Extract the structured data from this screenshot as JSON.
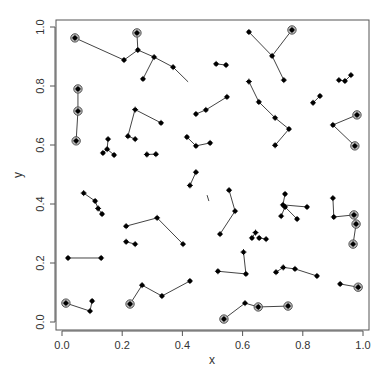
{
  "chart_data": {
    "type": "scatter",
    "title": "",
    "xlabel": "x",
    "ylabel": "y",
    "xlim": [
      0,
      1
    ],
    "ylim": [
      0,
      1
    ],
    "grid": false,
    "x_ticks": [
      "0.0",
      "0.2",
      "0.4",
      "0.6",
      "0.8",
      "1.0"
    ],
    "y_ticks": [
      "0.0",
      "0.2",
      "0.4",
      "0.6",
      "0.8",
      "1.0"
    ],
    "segments": [
      [
        [
          0.043,
          0.963
        ],
        [
          0.206,
          0.888
        ]
      ],
      [
        [
          0.206,
          0.888
        ],
        [
          0.252,
          0.922
        ]
      ],
      [
        [
          0.252,
          0.922
        ],
        [
          0.249,
          0.98
        ]
      ],
      [
        [
          0.252,
          0.922
        ],
        [
          0.306,
          0.898
        ]
      ],
      [
        [
          0.306,
          0.898
        ],
        [
          0.269,
          0.824
        ]
      ],
      [
        [
          0.306,
          0.898
        ],
        [
          0.369,
          0.864
        ]
      ],
      [
        [
          0.369,
          0.864
        ],
        [
          0.419,
          0.814
        ]
      ],
      [
        [
          0.053,
          0.79
        ],
        [
          0.053,
          0.715
        ]
      ],
      [
        [
          0.053,
          0.715
        ],
        [
          0.047,
          0.614
        ]
      ],
      [
        [
          0.243,
          0.722
        ],
        [
          0.219,
          0.63
        ]
      ],
      [
        [
          0.219,
          0.63
        ],
        [
          0.243,
          0.62
        ]
      ],
      [
        [
          0.243,
          0.72
        ],
        [
          0.329,
          0.675
        ]
      ],
      [
        [
          0.153,
          0.62
        ],
        [
          0.15,
          0.586
        ]
      ],
      [
        [
          0.15,
          0.586
        ],
        [
          0.136,
          0.573
        ]
      ],
      [
        [
          0.15,
          0.586
        ],
        [
          0.173,
          0.566
        ]
      ],
      [
        [
          0.282,
          0.568
        ],
        [
          0.312,
          0.569
        ]
      ],
      [
        [
          0.512,
          0.875
        ],
        [
          0.545,
          0.871
        ]
      ],
      [
        [
          0.445,
          0.705
        ],
        [
          0.478,
          0.719
        ]
      ],
      [
        [
          0.478,
          0.719
        ],
        [
          0.548,
          0.763
        ]
      ],
      [
        [
          0.415,
          0.627
        ],
        [
          0.445,
          0.597
        ]
      ],
      [
        [
          0.445,
          0.597
        ],
        [
          0.492,
          0.607
        ]
      ],
      [
        [
          0.425,
          0.463
        ],
        [
          0.445,
          0.508
        ]
      ],
      [
        [
          0.621,
          0.983
        ],
        [
          0.698,
          0.902
        ]
      ],
      [
        [
          0.698,
          0.902
        ],
        [
          0.764,
          0.99
        ]
      ],
      [
        [
          0.698,
          0.902
        ],
        [
          0.737,
          0.82
        ]
      ],
      [
        [
          0.621,
          0.815
        ],
        [
          0.654,
          0.746
        ]
      ],
      [
        [
          0.654,
          0.746
        ],
        [
          0.708,
          0.692
        ]
      ],
      [
        [
          0.708,
          0.692
        ],
        [
          0.754,
          0.654
        ]
      ],
      [
        [
          0.754,
          0.654
        ],
        [
          0.708,
          0.599
        ]
      ],
      [
        [
          0.92,
          0.82
        ],
        [
          0.94,
          0.817
        ]
      ],
      [
        [
          0.94,
          0.817
        ],
        [
          0.96,
          0.837
        ]
      ],
      [
        [
          0.834,
          0.743
        ],
        [
          0.857,
          0.766
        ]
      ],
      [
        [
          0.9,
          0.668
        ],
        [
          0.98,
          0.702
        ]
      ],
      [
        [
          0.9,
          0.668
        ],
        [
          0.973,
          0.597
        ]
      ],
      [
        [
          0.072,
          0.437
        ],
        [
          0.11,
          0.41
        ]
      ],
      [
        [
          0.11,
          0.41
        ],
        [
          0.12,
          0.385
        ]
      ],
      [
        [
          0.12,
          0.385
        ],
        [
          0.133,
          0.366
        ]
      ],
      [
        [
          0.213,
          0.325
        ],
        [
          0.316,
          0.353
        ]
      ],
      [
        [
          0.316,
          0.353
        ],
        [
          0.402,
          0.264
        ]
      ],
      [
        [
          0.213,
          0.272
        ],
        [
          0.243,
          0.264
        ]
      ],
      [
        [
          0.02,
          0.217
        ],
        [
          0.13,
          0.217
        ]
      ],
      [
        [
          0.013,
          0.064
        ],
        [
          0.093,
          0.037
        ]
      ],
      [
        [
          0.093,
          0.037
        ],
        [
          0.1,
          0.071
        ]
      ],
      [
        [
          0.226,
          0.061
        ],
        [
          0.266,
          0.125
        ]
      ],
      [
        [
          0.266,
          0.125
        ],
        [
          0.332,
          0.088
        ]
      ],
      [
        [
          0.332,
          0.088
        ],
        [
          0.425,
          0.139
        ]
      ],
      [
        [
          0.555,
          0.447
        ],
        [
          0.575,
          0.376
        ]
      ],
      [
        [
          0.575,
          0.376
        ],
        [
          0.525,
          0.298
        ]
      ],
      [
        [
          0.482,
          0.43
        ],
        [
          0.488,
          0.41
        ]
      ],
      [
        [
          0.741,
          0.434
        ],
        [
          0.734,
          0.397
        ]
      ],
      [
        [
          0.734,
          0.397
        ],
        [
          0.814,
          0.39
        ]
      ],
      [
        [
          0.728,
          0.359
        ],
        [
          0.741,
          0.39
        ]
      ],
      [
        [
          0.741,
          0.39
        ],
        [
          0.781,
          0.349
        ]
      ],
      [
        [
          0.9,
          0.42
        ],
        [
          0.903,
          0.356
        ]
      ],
      [
        [
          0.903,
          0.356
        ],
        [
          0.97,
          0.363
        ]
      ],
      [
        [
          0.97,
          0.363
        ],
        [
          0.977,
          0.332
        ]
      ],
      [
        [
          0.977,
          0.332
        ],
        [
          0.967,
          0.264
        ]
      ],
      [
        [
          0.631,
          0.285
        ],
        [
          0.643,
          0.303
        ]
      ],
      [
        [
          0.603,
          0.237
        ],
        [
          0.611,
          0.163
        ]
      ],
      [
        [
          0.611,
          0.163
        ],
        [
          0.518,
          0.172
        ]
      ],
      [
        [
          0.655,
          0.285
        ],
        [
          0.678,
          0.281
        ]
      ],
      [
        [
          0.711,
          0.169
        ],
        [
          0.735,
          0.185
        ]
      ],
      [
        [
          0.735,
          0.185
        ],
        [
          0.774,
          0.18
        ]
      ],
      [
        [
          0.774,
          0.18
        ],
        [
          0.847,
          0.156
        ]
      ],
      [
        [
          0.924,
          0.129
        ],
        [
          0.984,
          0.118
        ]
      ],
      [
        [
          0.538,
          0.01
        ],
        [
          0.608,
          0.064
        ]
      ],
      [
        [
          0.608,
          0.064
        ],
        [
          0.652,
          0.051
        ]
      ],
      [
        [
          0.652,
          0.051
        ],
        [
          0.751,
          0.054
        ]
      ]
    ],
    "points": [
      {
        "x": 0.043,
        "y": 0.963,
        "circled": true
      },
      {
        "x": 0.206,
        "y": 0.888,
        "circled": false
      },
      {
        "x": 0.252,
        "y": 0.922,
        "circled": false
      },
      {
        "x": 0.249,
        "y": 0.98,
        "circled": true
      },
      {
        "x": 0.306,
        "y": 0.898,
        "circled": false
      },
      {
        "x": 0.269,
        "y": 0.824,
        "circled": false
      },
      {
        "x": 0.369,
        "y": 0.864,
        "circled": false
      },
      {
        "x": 0.053,
        "y": 0.79,
        "circled": true
      },
      {
        "x": 0.053,
        "y": 0.715,
        "circled": true
      },
      {
        "x": 0.047,
        "y": 0.614,
        "circled": true
      },
      {
        "x": 0.243,
        "y": 0.72,
        "circled": false
      },
      {
        "x": 0.219,
        "y": 0.63,
        "circled": false
      },
      {
        "x": 0.243,
        "y": 0.62,
        "circled": false
      },
      {
        "x": 0.329,
        "y": 0.675,
        "circled": false
      },
      {
        "x": 0.153,
        "y": 0.62,
        "circled": false
      },
      {
        "x": 0.15,
        "y": 0.586,
        "circled": false
      },
      {
        "x": 0.136,
        "y": 0.573,
        "circled": false
      },
      {
        "x": 0.173,
        "y": 0.566,
        "circled": false
      },
      {
        "x": 0.282,
        "y": 0.568,
        "circled": false
      },
      {
        "x": 0.312,
        "y": 0.569,
        "circled": false
      },
      {
        "x": 0.512,
        "y": 0.875,
        "circled": false
      },
      {
        "x": 0.545,
        "y": 0.871,
        "circled": false
      },
      {
        "x": 0.445,
        "y": 0.705,
        "circled": false
      },
      {
        "x": 0.478,
        "y": 0.719,
        "circled": false
      },
      {
        "x": 0.548,
        "y": 0.763,
        "circled": false
      },
      {
        "x": 0.415,
        "y": 0.627,
        "circled": false
      },
      {
        "x": 0.445,
        "y": 0.597,
        "circled": false
      },
      {
        "x": 0.492,
        "y": 0.607,
        "circled": false
      },
      {
        "x": 0.425,
        "y": 0.463,
        "circled": false
      },
      {
        "x": 0.445,
        "y": 0.508,
        "circled": false
      },
      {
        "x": 0.621,
        "y": 0.983,
        "circled": false
      },
      {
        "x": 0.698,
        "y": 0.902,
        "circled": false
      },
      {
        "x": 0.764,
        "y": 0.99,
        "circled": true
      },
      {
        "x": 0.737,
        "y": 0.82,
        "circled": false
      },
      {
        "x": 0.621,
        "y": 0.815,
        "circled": false
      },
      {
        "x": 0.654,
        "y": 0.746,
        "circled": false
      },
      {
        "x": 0.708,
        "y": 0.692,
        "circled": false
      },
      {
        "x": 0.754,
        "y": 0.654,
        "circled": false
      },
      {
        "x": 0.708,
        "y": 0.599,
        "circled": false
      },
      {
        "x": 0.92,
        "y": 0.82,
        "circled": false
      },
      {
        "x": 0.94,
        "y": 0.817,
        "circled": false
      },
      {
        "x": 0.96,
        "y": 0.837,
        "circled": false
      },
      {
        "x": 0.834,
        "y": 0.743,
        "circled": false
      },
      {
        "x": 0.857,
        "y": 0.766,
        "circled": false
      },
      {
        "x": 0.9,
        "y": 0.668,
        "circled": false
      },
      {
        "x": 0.98,
        "y": 0.702,
        "circled": true
      },
      {
        "x": 0.973,
        "y": 0.597,
        "circled": true
      },
      {
        "x": 0.072,
        "y": 0.437,
        "circled": false
      },
      {
        "x": 0.11,
        "y": 0.41,
        "circled": false
      },
      {
        "x": 0.12,
        "y": 0.385,
        "circled": false
      },
      {
        "x": 0.133,
        "y": 0.366,
        "circled": false
      },
      {
        "x": 0.213,
        "y": 0.325,
        "circled": false
      },
      {
        "x": 0.316,
        "y": 0.353,
        "circled": false
      },
      {
        "x": 0.402,
        "y": 0.264,
        "circled": false
      },
      {
        "x": 0.213,
        "y": 0.272,
        "circled": false
      },
      {
        "x": 0.243,
        "y": 0.264,
        "circled": false
      },
      {
        "x": 0.02,
        "y": 0.217,
        "circled": false
      },
      {
        "x": 0.13,
        "y": 0.217,
        "circled": false
      },
      {
        "x": 0.013,
        "y": 0.064,
        "circled": true
      },
      {
        "x": 0.093,
        "y": 0.037,
        "circled": false
      },
      {
        "x": 0.1,
        "y": 0.071,
        "circled": false
      },
      {
        "x": 0.226,
        "y": 0.061,
        "circled": true
      },
      {
        "x": 0.266,
        "y": 0.125,
        "circled": false
      },
      {
        "x": 0.332,
        "y": 0.088,
        "circled": false
      },
      {
        "x": 0.425,
        "y": 0.139,
        "circled": false
      },
      {
        "x": 0.555,
        "y": 0.447,
        "circled": false
      },
      {
        "x": 0.575,
        "y": 0.376,
        "circled": false
      },
      {
        "x": 0.525,
        "y": 0.298,
        "circled": false
      },
      {
        "x": 0.741,
        "y": 0.434,
        "circled": false
      },
      {
        "x": 0.734,
        "y": 0.397,
        "circled": false
      },
      {
        "x": 0.814,
        "y": 0.39,
        "circled": false
      },
      {
        "x": 0.728,
        "y": 0.359,
        "circled": false
      },
      {
        "x": 0.741,
        "y": 0.39,
        "circled": false
      },
      {
        "x": 0.781,
        "y": 0.349,
        "circled": false
      },
      {
        "x": 0.9,
        "y": 0.42,
        "circled": false
      },
      {
        "x": 0.903,
        "y": 0.356,
        "circled": false
      },
      {
        "x": 0.97,
        "y": 0.363,
        "circled": true
      },
      {
        "x": 0.977,
        "y": 0.332,
        "circled": true
      },
      {
        "x": 0.967,
        "y": 0.264,
        "circled": true
      },
      {
        "x": 0.631,
        "y": 0.285,
        "circled": false
      },
      {
        "x": 0.643,
        "y": 0.303,
        "circled": false
      },
      {
        "x": 0.603,
        "y": 0.237,
        "circled": false
      },
      {
        "x": 0.611,
        "y": 0.163,
        "circled": false
      },
      {
        "x": 0.518,
        "y": 0.172,
        "circled": false
      },
      {
        "x": 0.655,
        "y": 0.285,
        "circled": false
      },
      {
        "x": 0.678,
        "y": 0.281,
        "circled": false
      },
      {
        "x": 0.711,
        "y": 0.169,
        "circled": false
      },
      {
        "x": 0.735,
        "y": 0.185,
        "circled": false
      },
      {
        "x": 0.774,
        "y": 0.18,
        "circled": false
      },
      {
        "x": 0.847,
        "y": 0.156,
        "circled": false
      },
      {
        "x": 0.924,
        "y": 0.129,
        "circled": false
      },
      {
        "x": 0.984,
        "y": 0.118,
        "circled": true
      },
      {
        "x": 0.538,
        "y": 0.01,
        "circled": true
      },
      {
        "x": 0.608,
        "y": 0.064,
        "circled": false
      },
      {
        "x": 0.652,
        "y": 0.051,
        "circled": true
      },
      {
        "x": 0.751,
        "y": 0.054,
        "circled": true
      }
    ]
  }
}
